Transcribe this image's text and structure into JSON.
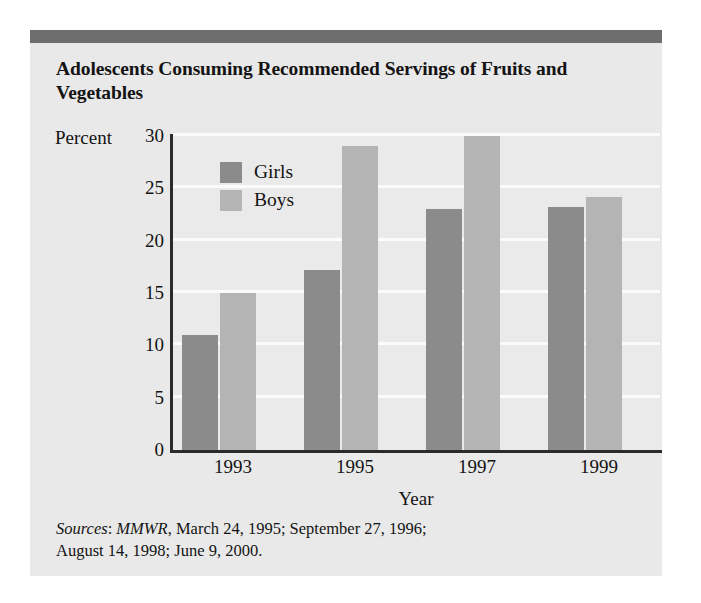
{
  "figure": {
    "title": "Adolescents Consuming Recommended Servings of Fruits and Vegetables",
    "sources_label": "Sources",
    "sources_journal": "MMWR",
    "sources_rest_line1": ", March 24, 1995; September 27, 1996;",
    "sources_line2": "August 14, 1998; June 9, 2000.",
    "colors": {
      "header_bar": "#6e6e6e",
      "card_background": "#e9e9e9",
      "plot_background": "#eaeaea",
      "gridline": "#fbfbfb",
      "axis": "#2b2b2b",
      "girls_bar": "#8b8b8b",
      "boys_bar": "#b4b4b4",
      "text": "#141414"
    }
  },
  "chart_data": {
    "type": "bar",
    "title": "Adolescents Consuming Recommended Servings of Fruits and Vegetables",
    "xlabel": "Year",
    "ylabel": "Percent",
    "categories": [
      "1993",
      "1995",
      "1997",
      "1999"
    ],
    "series": [
      {
        "name": "Girls",
        "color": "#8b8b8b",
        "values": [
          11,
          17.2,
          23,
          23.2
        ]
      },
      {
        "name": "Boys",
        "color": "#b4b4b4",
        "values": [
          15,
          29,
          30,
          24.2
        ]
      }
    ],
    "ylim": [
      0,
      30
    ],
    "yticks": [
      0,
      5,
      10,
      15,
      20,
      25,
      30
    ],
    "ytick_labels": [
      "0",
      "5",
      "10",
      "15",
      "20",
      "25",
      "30"
    ],
    "grid": true,
    "legend_position": "upper-left-inside",
    "legend_entries": [
      "Girls",
      "Boys"
    ]
  }
}
